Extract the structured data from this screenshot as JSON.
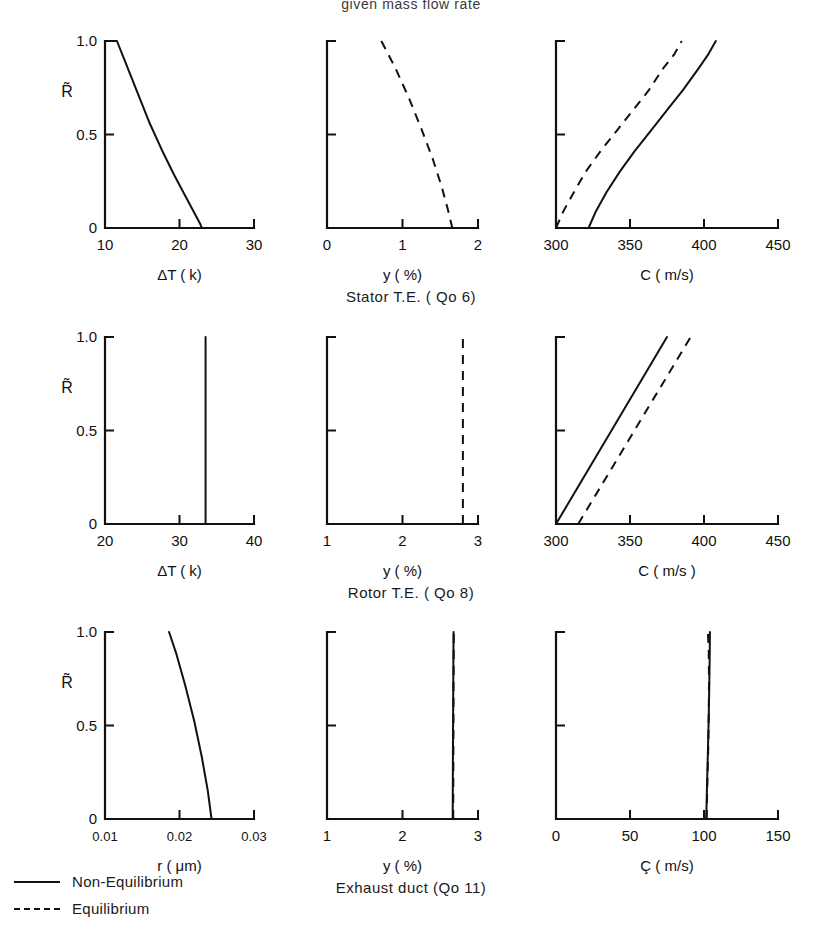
{
  "header": {
    "text": "given  mass  flow  rate"
  },
  "legend": {
    "items": [
      {
        "style": "solid",
        "label": "Non-Equilibrium"
      },
      {
        "style": "dashed",
        "label": "Equilibrium"
      }
    ]
  },
  "row_captions": [
    "Stator   T.E. ( Qo 6)",
    "Rotor   T.E. ( Qo 8)",
    "Exhaust   duct  (Qo 11)"
  ],
  "shared": {
    "ylabel": "R̃",
    "yticks": [
      "0",
      "0.5",
      "1.0"
    ],
    "ylim": [
      0,
      1
    ]
  },
  "chart_data": [
    {
      "id": "stator-dt",
      "type": "line",
      "row": "Stator T.E. (Qo 6)",
      "title": "",
      "xlabel": "ΔT ( k)",
      "ylabel": "R̃",
      "xlim": [
        10,
        30
      ],
      "ylim": [
        0,
        1
      ],
      "xticks": [
        10,
        20,
        30
      ],
      "xtick_labels": [
        "10",
        "20",
        "30"
      ],
      "yticks": [
        0,
        0.5,
        1.0
      ],
      "ytick_labels": [
        "0",
        "0.5",
        "1.0"
      ],
      "grid": false,
      "series": [
        {
          "name": "Non-Equilibrium",
          "style": "solid",
          "x": [
            10.0,
            11.6,
            12.4,
            13.4,
            14.6,
            16.0,
            17.6,
            19.2,
            20.8,
            22.0,
            22.8,
            23.0
          ],
          "y": [
            1.0,
            1.0,
            0.92,
            0.82,
            0.7,
            0.56,
            0.42,
            0.29,
            0.17,
            0.08,
            0.02,
            0.0
          ]
        }
      ]
    },
    {
      "id": "stator-y",
      "type": "line",
      "row": "Stator T.E. (Qo 6)",
      "title": "",
      "xlabel": "y ( %)",
      "ylabel": "",
      "xlim": [
        0,
        2
      ],
      "ylim": [
        0,
        1
      ],
      "xticks": [
        0,
        1,
        2
      ],
      "xtick_labels": [
        "0",
        "1",
        "2"
      ],
      "yticks": [
        0,
        0.5,
        1.0
      ],
      "ytick_labels": [
        "",
        "",
        ""
      ],
      "grid": false,
      "series": [
        {
          "name": "Equilibrium",
          "style": "dashed",
          "x": [
            0.72,
            0.9,
            1.08,
            1.25,
            1.4,
            1.52,
            1.6,
            1.66
          ],
          "y": [
            1.0,
            0.86,
            0.7,
            0.53,
            0.37,
            0.22,
            0.1,
            0.0
          ]
        }
      ]
    },
    {
      "id": "stator-c",
      "type": "line",
      "row": "Stator T.E. (Qo 6)",
      "title": "",
      "xlabel": "C ( m/s)",
      "ylabel": "",
      "xlim": [
        300,
        450
      ],
      "ylim": [
        0,
        1
      ],
      "xticks": [
        300,
        350,
        400,
        450
      ],
      "xtick_labels": [
        "300",
        "350",
        "400",
        "450"
      ],
      "yticks": [
        0,
        0.5,
        1.0
      ],
      "ytick_labels": [
        "",
        "",
        ""
      ],
      "grid": false,
      "series": [
        {
          "name": "Non-Equilibrium",
          "style": "solid",
          "x": [
            322,
            327,
            334,
            343,
            353,
            364,
            375,
            386,
            396,
            403,
            408
          ],
          "y": [
            0.0,
            0.09,
            0.19,
            0.3,
            0.41,
            0.52,
            0.63,
            0.74,
            0.85,
            0.93,
            1.0
          ]
        },
        {
          "name": "Equilibrium",
          "style": "dashed",
          "x": [
            300,
            305,
            312,
            320,
            330,
            341,
            352,
            363,
            372,
            380,
            385
          ],
          "y": [
            0.0,
            0.09,
            0.19,
            0.3,
            0.41,
            0.52,
            0.63,
            0.74,
            0.85,
            0.93,
            1.0
          ]
        }
      ]
    },
    {
      "id": "rotor-dt",
      "type": "line",
      "row": "Rotor T.E. (Qo 8)",
      "title": "",
      "xlabel": "ΔT ( k)",
      "ylabel": "R̃",
      "xlim": [
        20,
        40
      ],
      "ylim": [
        0,
        1
      ],
      "xticks": [
        20,
        30,
        40
      ],
      "xtick_labels": [
        "20",
        "30",
        "40"
      ],
      "yticks": [
        0,
        0.5,
        1.0
      ],
      "ytick_labels": [
        "0",
        "0.5",
        "1.0"
      ],
      "grid": false,
      "series": [
        {
          "name": "Non-Equilibrium",
          "style": "solid",
          "x": [
            33.5,
            33.5
          ],
          "y": [
            0.0,
            1.0
          ]
        }
      ]
    },
    {
      "id": "rotor-y",
      "type": "line",
      "row": "Rotor T.E. (Qo 8)",
      "title": "",
      "xlabel": "y  ( %)",
      "ylabel": "",
      "xlim": [
        1,
        3
      ],
      "ylim": [
        0,
        1
      ],
      "xticks": [
        1,
        2,
        3
      ],
      "xtick_labels": [
        "1",
        "2",
        "3"
      ],
      "yticks": [
        0,
        0.5,
        1.0
      ],
      "ytick_labels": [
        "",
        "",
        ""
      ],
      "grid": false,
      "series": [
        {
          "name": "Equilibrium",
          "style": "dashed",
          "x": [
            2.8,
            2.8
          ],
          "y": [
            0.0,
            1.0
          ]
        }
      ]
    },
    {
      "id": "rotor-c",
      "type": "line",
      "row": "Rotor T.E. (Qo 8)",
      "title": "",
      "xlabel": "C ( m/s )",
      "ylabel": "",
      "xlim": [
        300,
        450
      ],
      "ylim": [
        0,
        1
      ],
      "xticks": [
        300,
        350,
        400,
        450
      ],
      "xtick_labels": [
        "300",
        "350",
        "400",
        "450"
      ],
      "yticks": [
        0,
        0.5,
        1.0
      ],
      "ytick_labels": [
        "",
        "",
        ""
      ],
      "grid": false,
      "series": [
        {
          "name": "Non-Equilibrium",
          "style": "solid",
          "x": [
            300,
            375
          ],
          "y": [
            0.0,
            1.0
          ]
        },
        {
          "name": "Equilibrium",
          "style": "dashed",
          "x": [
            315,
            391
          ],
          "y": [
            0.0,
            1.0
          ]
        }
      ]
    },
    {
      "id": "exhaust-r",
      "type": "line",
      "row": "Exhaust duct (Qo 11)",
      "title": "",
      "xlabel": "r ( μm)",
      "ylabel": "R̃",
      "xlim": [
        0.01,
        0.03
      ],
      "ylim": [
        0,
        1
      ],
      "xticks": [
        0.01,
        0.02,
        0.03
      ],
      "xtick_labels": [
        "0.01",
        "0.02",
        "0.03"
      ],
      "yticks": [
        0,
        0.5,
        1.0
      ],
      "ytick_labels": [
        "0",
        "0.5",
        "1.0"
      ],
      "grid": false,
      "series": [
        {
          "name": "Non-Equilibrium",
          "style": "solid",
          "x": [
            0.0243,
            0.0238,
            0.023,
            0.022,
            0.0208,
            0.0196,
            0.0186
          ],
          "y": [
            0.0,
            0.15,
            0.33,
            0.52,
            0.71,
            0.88,
            1.0
          ]
        }
      ]
    },
    {
      "id": "exhaust-y",
      "type": "line",
      "row": "Exhaust duct (Qo 11)",
      "title": "",
      "xlabel": "y ( %)",
      "ylabel": "",
      "xlim": [
        1,
        3
      ],
      "ylim": [
        0,
        1
      ],
      "xticks": [
        1,
        2,
        3
      ],
      "xtick_labels": [
        "1",
        "2",
        "3"
      ],
      "yticks": [
        0,
        0.5,
        1.0
      ],
      "ytick_labels": [
        "",
        "",
        ""
      ],
      "grid": false,
      "series": [
        {
          "name": "Non-Equilibrium",
          "style": "solid",
          "x": [
            2.665,
            2.668,
            2.672,
            2.676
          ],
          "y": [
            0.0,
            0.35,
            0.7,
            1.0
          ]
        },
        {
          "name": "Equilibrium",
          "style": "dashed",
          "x": [
            2.672,
            2.674,
            2.676,
            2.68
          ],
          "y": [
            0.0,
            0.35,
            0.7,
            1.0
          ]
        }
      ]
    },
    {
      "id": "exhaust-c",
      "type": "line",
      "row": "Exhaust duct (Qo 11)",
      "title": "",
      "xlabel": "Ç ( m/s)",
      "ylabel": "",
      "xlim": [
        0,
        150
      ],
      "ylim": [
        0,
        1
      ],
      "xticks": [
        0,
        50,
        100,
        150
      ],
      "xtick_labels": [
        "0",
        "50",
        "100",
        "150"
      ],
      "yticks": [
        0,
        0.5,
        1.0
      ],
      "ytick_labels": [
        "",
        "",
        ""
      ],
      "grid": false,
      "series": [
        {
          "name": "Non-Equilibrium",
          "style": "solid",
          "x": [
            101.5,
            102.0,
            102.6,
            103.2,
            103.6,
            103.9,
            104.0
          ],
          "y": [
            0.0,
            0.17,
            0.35,
            0.55,
            0.73,
            0.9,
            1.0
          ]
        },
        {
          "name": "Equilibrium",
          "style": "dashed",
          "x": [
            101.8,
            102.2,
            102.8,
            103.2,
            103.4,
            103.2,
            102.6
          ],
          "y": [
            0.0,
            0.17,
            0.35,
            0.55,
            0.73,
            0.9,
            1.0
          ]
        }
      ]
    }
  ]
}
